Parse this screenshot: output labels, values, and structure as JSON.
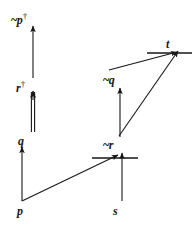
{
  "figure": {
    "kind": "proof-tableau-diagram",
    "width": 192,
    "height": 228,
    "background_color": "#ffffff",
    "ink_color": "#171717"
  },
  "nodes": [
    {
      "id": "np_dagger",
      "text": "~p",
      "negation": "~",
      "symbol": "p",
      "dagger": "†",
      "x": 30,
      "y": 18,
      "label": "~p†"
    },
    {
      "id": "r_dagger",
      "text": "r",
      "negation": "",
      "symbol": "r",
      "dagger": "†",
      "x": 30,
      "y": 86,
      "label": "r†"
    },
    {
      "id": "q",
      "text": "q",
      "negation": "",
      "symbol": "q",
      "dagger": "",
      "x": 30,
      "y": 139,
      "label": "q"
    },
    {
      "id": "p",
      "text": "p",
      "negation": "",
      "symbol": "p",
      "dagger": "",
      "x": 30,
      "y": 209,
      "label": "p"
    },
    {
      "id": "nq",
      "text": "~q",
      "negation": "~",
      "symbol": "q",
      "dagger": "",
      "x": 118,
      "y": 78,
      "label": "~q"
    },
    {
      "id": "nr",
      "text": "~r",
      "negation": "~",
      "symbol": "r",
      "dagger": "",
      "x": 118,
      "y": 143,
      "label": "~r"
    },
    {
      "id": "s",
      "text": "s",
      "negation": "",
      "symbol": "s",
      "dagger": "",
      "x": 118,
      "y": 209,
      "label": "s"
    },
    {
      "id": "t",
      "text": "t",
      "negation": "",
      "symbol": "t",
      "dagger": "",
      "x": 172,
      "y": 42,
      "label": "t"
    }
  ],
  "edges": [
    {
      "id": "edge-r-to-np",
      "from": "r_dagger",
      "to": "np_dagger",
      "style": "single",
      "x1": 33,
      "y1": 78,
      "x2": 33,
      "y2": 26
    },
    {
      "id": "edge-q-to-r",
      "from": "q",
      "to": "r_dagger",
      "style": "double",
      "x1": 33,
      "y1": 132,
      "x2": 33,
      "y2": 92
    },
    {
      "id": "edge-p-to-q",
      "from": "p",
      "to": "q",
      "style": "single",
      "x1": 22,
      "y1": 200,
      "x2": 22,
      "y2": 147
    },
    {
      "id": "edge-p-to-nr",
      "from": "p",
      "to": "nr",
      "style": "single",
      "x1": 22,
      "y1": 200,
      "x2": 116,
      "y2": 157
    },
    {
      "id": "edge-s-to-nr",
      "from": "s",
      "to": "nr",
      "style": "single",
      "x1": 122,
      "y1": 200,
      "x2": 122,
      "y2": 155
    },
    {
      "id": "edge-nr-to-nq",
      "from": "nr",
      "to": "nq",
      "style": "single",
      "x1": 120,
      "y1": 136,
      "x2": 120,
      "y2": 88
    },
    {
      "id": "edge-nq-to-t",
      "from": "nq",
      "to": "t",
      "style": "single",
      "x1": 112,
      "y1": 70,
      "x2": 176,
      "y2": 53
    },
    {
      "id": "edge-nr-to-t",
      "from": "nr",
      "to": "t",
      "style": "single",
      "x1": 120,
      "y1": 136,
      "x2": 177,
      "y2": 52
    }
  ],
  "closure_bars": [
    {
      "id": "bar-nr",
      "at": "nr",
      "x1": 92,
      "x2": 138,
      "y": 158
    },
    {
      "id": "bar-t",
      "at": "t",
      "x1": 147,
      "x2": 192,
      "y": 53
    }
  ],
  "a11y": {
    "figure_title": "Tableau diagram with nodes ~p†, r†, q, p, ~q, ~r, s, t"
  }
}
